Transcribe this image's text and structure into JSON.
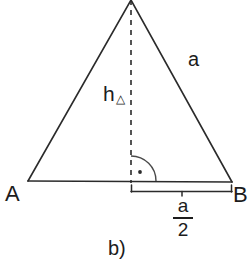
{
  "figure": {
    "caption": "b)",
    "background_color": "#ffffff",
    "stroke_color": "#2b2b2b",
    "labels": {
      "vertex_left": "A",
      "vertex_right": "B",
      "side_right": "a",
      "height": "h",
      "height_subscript": "△",
      "segment_numerator": "a",
      "segment_denominator": "2"
    },
    "geometry": {
      "apex": [
        131,
        0
      ],
      "vertex_left": [
        28,
        181
      ],
      "vertex_right": [
        232,
        182
      ],
      "altitude_foot": [
        131,
        181
      ],
      "altitude_style": "dashed",
      "right_angle_marker": "quarter-arc-with-dot",
      "right_angle_arc_radius": 25,
      "bracket_start_x": 131,
      "bracket_end_x": 232,
      "bracket_y": 191
    }
  }
}
